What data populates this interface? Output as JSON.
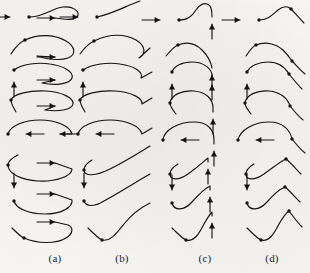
{
  "figure": {
    "background_color": "#f6f5f2",
    "ink_color": "#141414",
    "rows": 8,
    "columns": 4,
    "column_labels": [
      {
        "text": "(a)",
        "x": 55
      },
      {
        "text": "(b)",
        "x": 122
      },
      {
        "text": "(c)",
        "x": 205
      },
      {
        "text": "(d)",
        "x": 272
      }
    ],
    "row_entry_arrows": [
      "right",
      "right",
      "up",
      "none",
      "left",
      "none",
      "down",
      "none"
    ],
    "row_exit_arrows": [
      "right",
      "right",
      "right",
      "right",
      "left",
      "right",
      "right",
      "right"
    ]
  },
  "chart_data": {
    "type": "line",
    "xlabel": "",
    "ylabel": "",
    "grid": false,
    "legend": "none",
    "panels": [
      {
        "column": "(a)",
        "row": 1,
        "entry_arrow": {
          "dir": "right",
          "x": 10,
          "y": 17,
          "len": 18
        },
        "knot": {
          "x": 29,
          "y": 17
        },
        "path": "M29,17 C44,17 52,8 63,7 C73,6 79,11 78,15 C77,19 70,20 63,19 L55,18",
        "exit_arrow": {
          "dir": "right",
          "x": 55,
          "y": 18,
          "len": 18
        }
      },
      {
        "column": "(a)",
        "row": 2,
        "entry_arrow": {
          "dir": "none"
        },
        "knot": {
          "x": 25,
          "y": 40
        },
        "path": "M11,54 C16,46 20,42 25,40 C40,33 56,35 66,41 C76,47 76,55 68,58 C60,61 46,59 37,56 L55,57",
        "exit_arrow": {
          "dir": "right",
          "x": 55,
          "y": 57,
          "len": 18
        }
      },
      {
        "column": "(a)",
        "row": 3,
        "entry_arrow": {
          "dir": "up",
          "x": 14,
          "y": 82,
          "len": 15
        },
        "knot": {
          "x": 14,
          "y": 70
        },
        "path": "M14,70 C22,64 38,62 50,64 C64,66 74,72 72,78 C70,84 55,86 42,83 L55,80",
        "exit_arrow": {
          "dir": "right",
          "x": 55,
          "y": 80,
          "len": 18
        }
      },
      {
        "column": "(a)",
        "row": 4,
        "entry_arrow": {
          "dir": "none"
        },
        "knot": {
          "x": 11,
          "y": 100
        },
        "path": "M16,112 C13,107 11,103 11,100 C13,94 30,90 46,91 C62,92 74,98 73,104 C72,110 58,112 45,110 L55,106",
        "exit_arrow": {
          "dir": "right",
          "x": 55,
          "y": 106,
          "len": 18
        }
      },
      {
        "column": "(a)",
        "row": 5,
        "entry_arrow": {
          "dir": "left",
          "x": 26,
          "y": 134,
          "len": 18
        },
        "knot": {
          "x": 8,
          "y": 134
        },
        "path": "M8,134 C10,126 24,120 40,120 C56,120 70,126 72,134 L60,134",
        "exit_arrow": {
          "dir": "left",
          "x": 60,
          "y": 134,
          "len": 18
        }
      },
      {
        "column": "(a)",
        "row": 6,
        "entry_arrow": {
          "dir": "none"
        },
        "knot": {
          "x": 8,
          "y": 165
        },
        "path": "M18,155 C12,158 8,161 8,165 C8,174 22,180 38,181 C56,182 72,176 72,169 L55,163",
        "exit_arrow": {
          "dir": "right",
          "x": 55,
          "y": 163,
          "len": 18
        }
      },
      {
        "column": "(a)",
        "row": 7,
        "entry_arrow": {
          "dir": "down",
          "x": 14,
          "y": 188,
          "len": 15
        },
        "knot": {
          "x": 14,
          "y": 201
        },
        "path": "M14,201 C16,209 30,214 45,214 C62,214 73,207 72,200 L55,194",
        "exit_arrow": {
          "dir": "right",
          "x": 55,
          "y": 194,
          "len": 18
        }
      },
      {
        "column": "(a)",
        "row": 8,
        "entry_arrow": {
          "dir": "none"
        },
        "knot": {
          "x": 24,
          "y": 238
        },
        "path": "M12,228 C18,234 21,237 24,238 C38,244 56,244 66,238 C74,233 73,227 68,225 L55,222",
        "exit_arrow": {
          "dir": "right",
          "x": 55,
          "y": 222,
          "len": 18
        }
      },
      {
        "column": "(b)",
        "row": 1,
        "entry_arrow": {
          "dir": "right",
          "x": 78,
          "y": 17,
          "len": 18
        },
        "knot": {
          "x": 97,
          "y": 17
        },
        "path": "M97,17 C112,14 126,6 140,1",
        "exit_arrow": {
          "dir": "none"
        }
      },
      {
        "column": "(b)",
        "row": 2,
        "entry_arrow": {
          "dir": "none"
        },
        "knot": {
          "x": 94,
          "y": 41
        },
        "path": "M80,54 C85,47 90,43 94,41 C110,33 126,34 136,40 C146,46 146,54 139,58 L150,48",
        "exit_arrow": {
          "dir": "none"
        }
      },
      {
        "column": "(b)",
        "row": 3,
        "entry_arrow": {
          "dir": "up",
          "x": 83,
          "y": 82,
          "len": 15
        },
        "knot": {
          "x": 83,
          "y": 70
        },
        "path": "M83,70 C92,64 108,62 120,64 C134,66 144,72 141,78 L152,72",
        "exit_arrow": {
          "dir": "none"
        }
      },
      {
        "column": "(b)",
        "row": 4,
        "entry_arrow": {
          "dir": "none"
        },
        "knot": {
          "x": 80,
          "y": 100
        },
        "path": "M85,112 C82,107 80,103 80,100 C82,94 99,90 115,91 C131,92 143,98 142,104 L152,98",
        "exit_arrow": {
          "dir": "none"
        }
      },
      {
        "column": "(b)",
        "row": 5,
        "entry_arrow": {
          "dir": "left",
          "x": 96,
          "y": 134,
          "len": 18
        },
        "knot": {
          "x": 78,
          "y": 134
        },
        "path": "M78,134 C80,126 94,120 110,120 C126,120 140,126 142,134 L152,128",
        "exit_arrow": {
          "dir": "none"
        }
      },
      {
        "column": "(b)",
        "row": 6,
        "entry_arrow": {
          "dir": "none"
        },
        "knot": {
          "x": 84,
          "y": 170
        },
        "path": "M92,160 C87,163 84,166 84,170 C84,177 96,176 110,169 C126,161 140,152 150,146",
        "exit_arrow": {
          "dir": "none"
        }
      },
      {
        "column": "(b)",
        "row": 7,
        "entry_arrow": {
          "dir": "down",
          "x": 84,
          "y": 188,
          "len": 15
        },
        "knot": {
          "x": 84,
          "y": 201
        },
        "path": "M84,201 C86,207 94,207 104,201 C120,192 136,182 150,174",
        "exit_arrow": {
          "dir": "none"
        }
      },
      {
        "column": "(b)",
        "row": 8,
        "entry_arrow": {
          "dir": "none"
        },
        "knot": {
          "x": 102,
          "y": 240
        },
        "path": "M88,228 C95,235 99,239 102,240 C110,242 116,234 124,224 C132,214 142,207 150,203",
        "exit_arrow": {
          "dir": "none"
        }
      },
      {
        "column": "(c)",
        "row": 1,
        "entry_arrow": {
          "dir": "right",
          "x": 160,
          "y": 20,
          "len": 18
        },
        "knot": {
          "x": 179,
          "y": 20
        },
        "path": "M179,20 C188,20 192,16 196,10 C200,4 205,2 209,5 C212,7 212,12 212,17",
        "exit_arrow": {
          "dir": "up",
          "x": 212,
          "y": 24,
          "len": 15
        }
      },
      {
        "column": "(c)",
        "row": 2,
        "entry_arrow": {
          "dir": "none"
        },
        "knot": {
          "x": 178,
          "y": 45
        },
        "path": "M166,56 C171,50 175,46 178,45 C188,41 196,44 202,50 C208,56 211,62 212,68",
        "exit_arrow": {
          "dir": "up",
          "x": 212,
          "y": 75,
          "len": 15
        }
      },
      {
        "column": "(c)",
        "row": 3,
        "entry_arrow": {
          "dir": "up",
          "x": 172,
          "y": 84,
          "len": 15
        },
        "knot": {
          "x": 172,
          "y": 72
        },
        "path": "M172,72 C174,66 182,62 192,62 C202,62 210,67 212,74 L212,78",
        "exit_arrow": {
          "dir": "up",
          "x": 212,
          "y": 85,
          "len": 15
        }
      },
      {
        "column": "(c)",
        "row": 4,
        "entry_arrow": {
          "dir": "none"
        },
        "knot": {
          "x": 170,
          "y": 103
        },
        "path": "M176,114 C172,109 170,106 170,103 C171,95 182,90 194,91 C206,92 213,99 213,108 L213,112",
        "exit_arrow": {
          "dir": "up",
          "x": 213,
          "y": 119,
          "len": 15
        }
      },
      {
        "column": "(c)",
        "row": 5,
        "entry_arrow": {
          "dir": "left",
          "x": 181,
          "y": 140,
          "len": 18
        },
        "knot": {
          "x": 163,
          "y": 140
        },
        "path": "M163,140 C164,130 178,122 194,122 C208,122 214,130 214,140 L214,144",
        "exit_arrow": {
          "dir": "up",
          "x": 214,
          "y": 151,
          "len": 15
        }
      },
      {
        "column": "(c)",
        "row": 6,
        "entry_arrow": {
          "dir": "none"
        },
        "knot": {
          "x": 170,
          "y": 174
        },
        "path": "M178,164 C173,167 170,170 170,174 C170,180 178,181 188,174 C198,167 204,161 208,158 L208,162",
        "exit_arrow": {
          "dir": "up",
          "x": 208,
          "y": 169,
          "len": 15
        }
      },
      {
        "column": "(c)",
        "row": 7,
        "entry_arrow": {
          "dir": "down",
          "x": 172,
          "y": 190,
          "len": 15
        },
        "knot": {
          "x": 172,
          "y": 203
        },
        "path": "M172,203 C174,211 184,211 192,202 C200,193 206,188 210,186 L210,190",
        "exit_arrow": {
          "dir": "up",
          "x": 210,
          "y": 197,
          "len": 15
        }
      },
      {
        "column": "(c)",
        "row": 8,
        "entry_arrow": {
          "dir": "none"
        },
        "knot": {
          "x": 186,
          "y": 240
        },
        "path": "M172,228 C180,236 183,239 186,240 C194,242 199,234 204,224 C208,217 210,214 212,212 L212,216",
        "exit_arrow": {
          "dir": "up",
          "x": 212,
          "y": 223,
          "len": 15
        }
      },
      {
        "column": "(d)",
        "row": 1,
        "entry_arrow": {
          "dir": "right",
          "x": 240,
          "y": 20,
          "len": 18
        },
        "knot": {
          "x": 259,
          "y": 20
        },
        "path": "M259,20 C268,20 272,15 278,10 C283,6 288,6 291,9",
        "knot2": {
          "x": 291,
          "y": 9
        },
        "tail": "M291,9 C295,13 299,18 304,23",
        "exit_arrow": {
          "dir": "none"
        }
      },
      {
        "column": "(d)",
        "row": 2,
        "entry_arrow": {
          "dir": "none"
        },
        "knot": {
          "x": 256,
          "y": 45
        },
        "path": "M246,56 C250,50 253,46 256,45 C266,41 276,44 283,50 C287,54 290,58 292,61",
        "knot2": {
          "x": 292,
          "y": 61
        },
        "tail": "M292,61 C296,65 300,70 305,74",
        "exit_arrow": {
          "dir": "none"
        }
      },
      {
        "column": "(d)",
        "row": 3,
        "entry_arrow": {
          "dir": "up",
          "x": 247,
          "y": 84,
          "len": 15
        },
        "knot": {
          "x": 247,
          "y": 72
        },
        "path": "M247,72 C250,66 258,62 268,62 C278,62 285,67 289,74",
        "knot2": {
          "x": 289,
          "y": 74
        },
        "tail": "M289,74 C293,79 297,84 302,89",
        "exit_arrow": {
          "dir": "none"
        }
      },
      {
        "column": "(d)",
        "row": 4,
        "entry_arrow": {
          "dir": "none"
        },
        "knot": {
          "x": 245,
          "y": 103
        },
        "path": "M251,114 C247,109 245,106 245,103 C246,95 257,90 269,91 C281,92 288,99 290,106",
        "knot2": {
          "x": 290,
          "y": 106
        },
        "tail": "M290,106 C294,111 298,116 303,120",
        "exit_arrow": {
          "dir": "none"
        }
      },
      {
        "column": "(d)",
        "row": 5,
        "entry_arrow": {
          "dir": "left",
          "x": 256,
          "y": 140,
          "len": 18
        },
        "knot": {
          "x": 238,
          "y": 140
        },
        "path": "M238,140 C240,130 254,122 269,122 C283,122 290,130 292,139",
        "knot2": {
          "x": 292,
          "y": 139
        },
        "tail": "M292,139 C296,144 300,149 305,153",
        "exit_arrow": {
          "dir": "none"
        }
      },
      {
        "column": "(d)",
        "row": 6,
        "entry_arrow": {
          "dir": "none"
        },
        "knot": {
          "x": 246,
          "y": 174
        },
        "path": "M254,164 C249,167 246,170 246,174 C246,180 254,181 264,174 C274,167 281,161 286,159",
        "knot2": {
          "x": 286,
          "y": 159
        },
        "tail": "M286,159 C291,163 296,169 301,174",
        "exit_arrow": {
          "dir": "none"
        }
      },
      {
        "column": "(d)",
        "row": 7,
        "entry_arrow": {
          "dir": "down",
          "x": 247,
          "y": 190,
          "len": 15
        },
        "knot": {
          "x": 247,
          "y": 203
        },
        "path": "M247,203 C249,211 259,211 267,202 C274,194 280,189 285,187",
        "knot2": {
          "x": 285,
          "y": 187
        },
        "tail": "M285,187 C290,191 295,197 300,202",
        "exit_arrow": {
          "dir": "none"
        }
      },
      {
        "column": "(d)",
        "row": 8,
        "entry_arrow": {
          "dir": "none"
        },
        "knot": {
          "x": 261,
          "y": 240
        },
        "path": "M247,228 C255,236 258,239 261,240 C269,242 274,234 279,224 C283,217 286,213 289,211",
        "knot2": {
          "x": 289,
          "y": 211
        },
        "tail": "M289,211 C293,216 297,222 302,227",
        "exit_arrow": {
          "dir": "none"
        }
      }
    ]
  }
}
